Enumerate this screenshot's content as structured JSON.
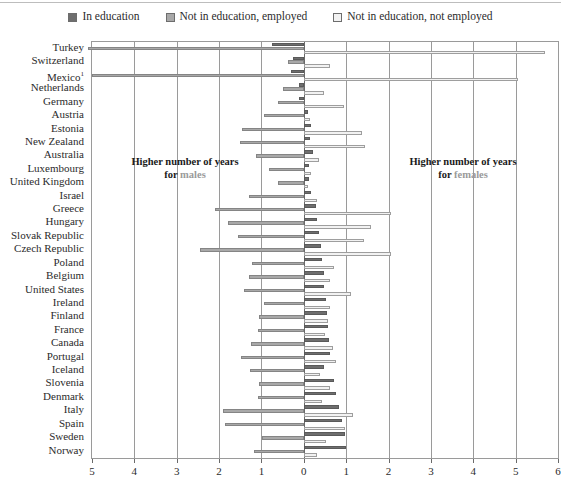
{
  "legend": {
    "items": [
      {
        "label": "In education",
        "swatch": "#6e6e6e",
        "icon": "legend-swatch-dark"
      },
      {
        "label": "Not in education, employed",
        "swatch": "#a8a8a8",
        "icon": "legend-swatch-mid"
      },
      {
        "label": "Not in education, not employed",
        "swatch": "#f2f2f2",
        "icon": "legend-swatch-light"
      }
    ]
  },
  "annotations": {
    "left_line1": "Higher number of years",
    "left_line2_prefix": "for ",
    "left_line2_word": "males",
    "right_line1": "Higher number of years",
    "right_line2_prefix": "for ",
    "right_line2_word": "females"
  },
  "axis": {
    "unit_label": "Years",
    "ticks": [
      "5",
      "4",
      "3",
      "2",
      "1",
      "0",
      "1",
      "2",
      "3",
      "4",
      "5",
      "6"
    ],
    "tick_values": [
      -5,
      -4,
      -3,
      -2,
      -1,
      0,
      1,
      2,
      3,
      4,
      5,
      6
    ]
  },
  "chart_data": {
    "type": "bar",
    "orientation": "horizontal-diverging",
    "title": "",
    "subtitle": "",
    "xlabel": "Years",
    "ylabel": "",
    "xlim": [
      -5,
      6
    ],
    "grid": true,
    "legend_position": "top-center",
    "note": "Negative values = higher number of years for males; positive values = higher number of years for females.",
    "series_names": [
      "In education",
      "Not in education, employed",
      "Not in education, not employed"
    ],
    "categories": [
      "Turkey",
      "Switzerland",
      "Mexico¹",
      "Netherlands",
      "Germany",
      "Austria",
      "Estonia",
      "New Zealand",
      "Australia",
      "Luxembourg",
      "United Kingdom",
      "Israel",
      "Greece",
      "Hungary",
      "Slovak Republic",
      "Czech Republic",
      "Poland",
      "Belgium",
      "United States",
      "Ireland",
      "Finland",
      "France",
      "Canada",
      "Portugal",
      "Iceland",
      "Slovenia",
      "Denmark",
      "Italy",
      "Spain",
      "Sweden",
      "Norway"
    ],
    "series": [
      {
        "name": "In education",
        "values": [
          -0.75,
          -0.25,
          -0.3,
          -0.12,
          -0.12,
          0.1,
          0.18,
          0.15,
          0.22,
          0.12,
          0.12,
          0.18,
          0.28,
          0.32,
          0.35,
          0.4,
          0.42,
          0.48,
          0.48,
          0.52,
          0.55,
          0.58,
          0.6,
          0.62,
          0.48,
          0.72,
          0.75,
          0.82,
          0.9,
          0.98,
          1.0
        ]
      },
      {
        "name": "Not in education, employed",
        "values": [
          -5.1,
          -0.38,
          -5.0,
          -0.48,
          -0.62,
          -0.95,
          -1.45,
          -1.5,
          -1.12,
          -0.82,
          -0.62,
          -1.3,
          -2.1,
          -1.8,
          -1.55,
          -2.45,
          -1.22,
          -1.3,
          -1.42,
          -0.95,
          -1.05,
          -1.08,
          -1.25,
          -1.48,
          -1.28,
          -1.05,
          -1.08,
          -1.9,
          -1.85,
          -0.98,
          -1.18
        ]
      },
      {
        "name": "Not in education, not employed",
        "values": [
          5.7,
          0.62,
          5.05,
          0.48,
          0.95,
          0.15,
          1.38,
          1.45,
          0.35,
          0.18,
          0.1,
          0.32,
          2.05,
          1.58,
          1.42,
          2.05,
          0.72,
          0.62,
          1.12,
          0.62,
          0.58,
          0.5,
          0.68,
          0.75,
          0.38,
          0.62,
          0.42,
          1.15,
          0.98,
          0.52,
          0.3
        ]
      }
    ]
  }
}
